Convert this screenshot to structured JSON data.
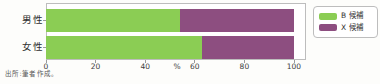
{
  "figure": {
    "source_note": "出所:筆者作成。"
  },
  "chart_data": {
    "type": "bar",
    "orientation": "horizontal_stacked",
    "title": "",
    "categories": [
      "男性",
      "女性"
    ],
    "series": [
      {
        "name": "B 候補",
        "color": "#8bcd54",
        "values": [
          54,
          63
        ]
      },
      {
        "name": "X 候補",
        "color": "#8d4e80",
        "values": [
          46,
          37
        ]
      }
    ],
    "x_ticks": [
      0,
      20,
      40,
      60,
      80,
      100
    ],
    "xlim": [
      0,
      100
    ],
    "x_unit_label": "%",
    "legend_position": "right",
    "grid": false
  },
  "colors": {
    "background": "#fdfdfb",
    "plot_border": "#bdbdbd",
    "axis_text": "#3c3c3c",
    "series_green": "#8bcd54",
    "series_purple": "#8d4e80"
  }
}
